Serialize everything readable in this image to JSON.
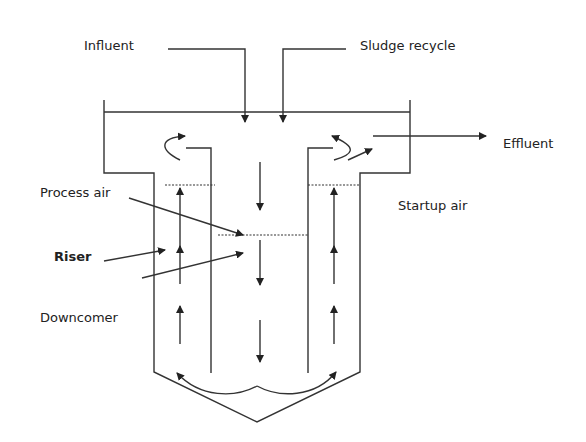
{
  "diagram": {
    "labels": {
      "influent": "Influent",
      "sludge_recycle": "Sludge recycle",
      "effluent": "Effluent",
      "process_air": "Process air",
      "startup_air": "Startup air",
      "riser": "Riser",
      "downcomer": "Downcomer"
    },
    "colors": {
      "line": "#333333",
      "text": "#222222",
      "background": "#ffffff"
    }
  }
}
